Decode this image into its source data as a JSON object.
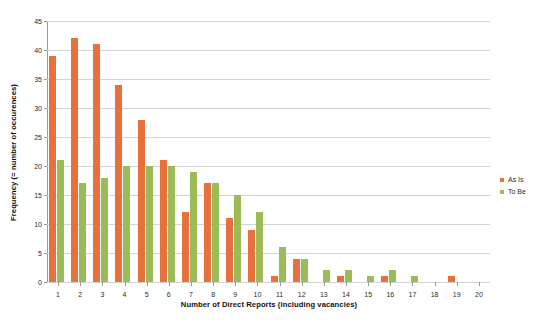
{
  "chart_data": {
    "type": "bar",
    "title": "",
    "xlabel": "Number of Direct Reports (including vacancies)",
    "ylabel": "Frequency (= number of occurences)",
    "categories": [
      "1",
      "2",
      "3",
      "4",
      "5",
      "6",
      "7",
      "8",
      "9",
      "10",
      "11",
      "12",
      "13",
      "14",
      "15",
      "16",
      "17",
      "18",
      "19",
      "20"
    ],
    "series": [
      {
        "name": "As Is",
        "color": "#e8703a",
        "values": [
          39,
          42,
          41,
          34,
          28,
          21,
          12,
          17,
          11,
          9,
          1,
          4,
          0,
          1,
          0,
          1,
          0,
          0,
          1,
          0
        ]
      },
      {
        "name": "To Be",
        "color": "#9bbb59",
        "values": [
          21,
          17,
          18,
          20,
          20,
          20,
          19,
          17,
          15,
          12,
          6,
          4,
          2,
          2,
          1,
          2,
          1,
          0,
          0,
          0
        ]
      }
    ],
    "ylim": [
      0,
      45
    ],
    "yticks": [
      0,
      5,
      10,
      15,
      20,
      25,
      30,
      35,
      40,
      45
    ],
    "grid": true,
    "legend_position": "right"
  },
  "legend": {
    "entries": [
      {
        "label": "As Is"
      },
      {
        "label": "To Be"
      }
    ]
  }
}
